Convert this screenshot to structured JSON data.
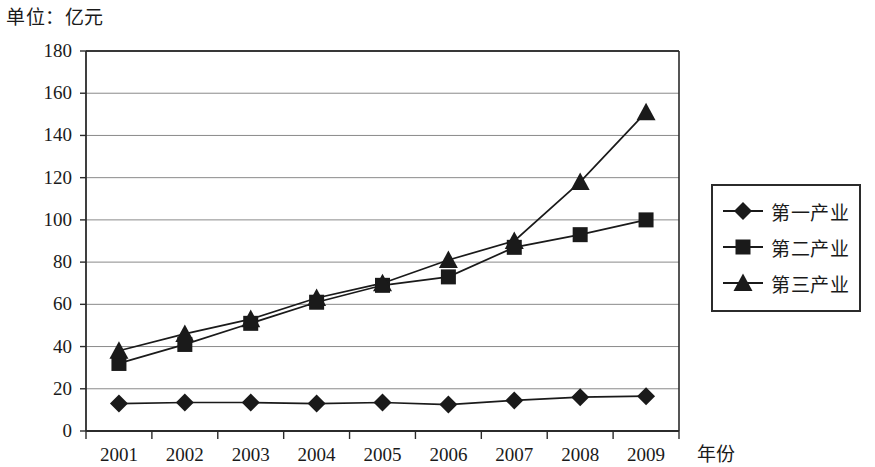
{
  "unit_note": "单位：亿元",
  "axis": {
    "x_title": "年份",
    "y_ticks": [
      "180",
      "160",
      "140",
      "120",
      "100",
      "80",
      "60",
      "40",
      "20",
      "0"
    ],
    "x_ticks": [
      "2001",
      "2002",
      "2003",
      "2004",
      "2005",
      "2006",
      "2007",
      "2008",
      "2009"
    ]
  },
  "legend": {
    "items": [
      {
        "label": "第一产业",
        "marker": "diamond-marker"
      },
      {
        "label": "第二产业",
        "marker": "square-marker"
      },
      {
        "label": "第三产业",
        "marker": "triangle-marker"
      }
    ]
  },
  "colors": {
    "ink": "#1a1a1a",
    "grid": "#8a8a8a",
    "axis": "#2b2b2b",
    "plot_background": "#ffffff"
  },
  "chart_data": {
    "type": "line",
    "title": "",
    "subtitle": "",
    "xlabel": "年份",
    "ylabel": "单位：亿元",
    "categories": [
      "2001",
      "2002",
      "2003",
      "2004",
      "2005",
      "2006",
      "2007",
      "2008",
      "2009"
    ],
    "x": [
      2001,
      2002,
      2003,
      2004,
      2005,
      2006,
      2007,
      2008,
      2009
    ],
    "ylim": [
      0,
      180
    ],
    "ytick_step": 20,
    "grid": "horizontal",
    "legend_position": "right",
    "series": [
      {
        "name": "第一产业",
        "marker": "diamond",
        "values": [
          13,
          13.5,
          13.5,
          13,
          13.5,
          12.5,
          14.5,
          16,
          16.5
        ]
      },
      {
        "name": "第二产业",
        "marker": "square",
        "values": [
          32,
          41,
          51,
          61,
          69,
          73,
          87,
          93,
          100
        ]
      },
      {
        "name": "第三产业",
        "marker": "triangle",
        "values": [
          38,
          46,
          53,
          63,
          70,
          81,
          90,
          118,
          151
        ]
      }
    ]
  }
}
